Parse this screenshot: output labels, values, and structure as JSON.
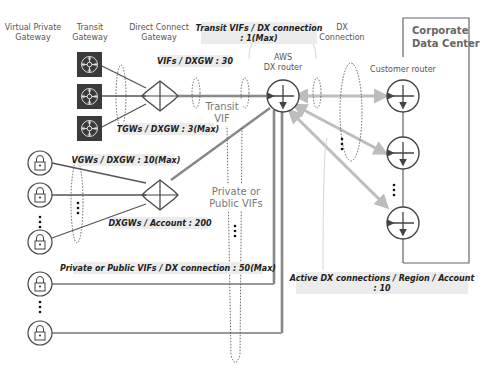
{
  "headers": {
    "vgw": [
      "Virtual Private",
      "Gateway"
    ],
    "tgw": [
      "Transit",
      "Gateway"
    ],
    "dxgw": [
      "Direct Connect",
      "Gateway"
    ],
    "aws_router": [
      "AWS",
      "DX router"
    ],
    "dx_connection": [
      "DX",
      "Connection"
    ],
    "customer_router": "Customer router",
    "corporate": [
      "Corporate",
      "Data Center"
    ]
  },
  "mid_labels": {
    "transit_vif": [
      "Transit",
      "VIF"
    ],
    "private_public_vifs": [
      "Private or",
      "Public VIFs"
    ]
  },
  "quota_labels": {
    "transit_vifs_per_dx": [
      "Transit VIFs / DX connection",
      ": 1(Max)"
    ],
    "vifs_per_dxgw": "VIFs / DXGW : 30",
    "tgws_per_dxgw": "TGWs / DXGW : 3(Max)",
    "vgws_per_dxgw": "VGWs / DXGW : 10(Max)",
    "dxgws_per_account": "DXGWs / Account : 200",
    "private_public_vifs_per_dx": "Private or Public VIFs / DX connection : 50(Max)",
    "active_dx_connections": [
      "Active DX connections / Region / Account",
      ": 10"
    ]
  },
  "nodes": {
    "transit_gateways": 3,
    "vgws_to_dxgw": 3,
    "vgws_direct": 2,
    "customer_routers": 3
  },
  "icons": {
    "transit_gateway": "tgw-hub-icon",
    "vgw": "lock-icon",
    "dxgw": "dxgw-arrows-icon",
    "router": "router-arrows-icon"
  },
  "colors": {
    "label_bg": "#ececec",
    "tgw_bg": "#3a3a3a",
    "dx_line": "#bdbdbd",
    "vif_line": "#888888"
  }
}
